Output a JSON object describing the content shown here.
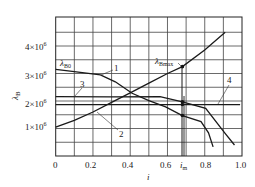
{
  "chart_data": {
    "type": "line",
    "title": "",
    "xlabel": "i",
    "ylabel": "λB",
    "xlim": [
      0,
      1.0
    ],
    "ylim": [
      0,
      5000000
    ],
    "grid": true,
    "x_ticks": [
      "0",
      "0.2",
      "0.4",
      "0.6",
      "0.8",
      "1.0"
    ],
    "x_tick_values": [
      0,
      0.2,
      0.4,
      0.6,
      0.8,
      1.0
    ],
    "y_ticks": [
      "1×10⁶",
      "2×10⁶",
      "3×10⁶",
      "4×10⁶"
    ],
    "y_tick_values": [
      1000000,
      2000000,
      3000000,
      4000000
    ],
    "special_x_tick": {
      "label": "i_m",
      "value": 0.68
    },
    "series": [
      {
        "name": "1",
        "x": [
          0,
          0.1,
          0.24,
          0.32,
          0.41,
          0.5,
          0.59,
          0.68,
          0.78,
          0.82,
          0.845
        ],
        "y": [
          3150000,
          3070000,
          2950000,
          2700000,
          2280000,
          2010000,
          1790000,
          1470000,
          1250000,
          840000,
          330000
        ]
      },
      {
        "name": "2",
        "x": [
          0,
          0.1,
          0.2,
          0.3,
          0.4,
          0.5,
          0.6,
          0.68,
          0.8,
          0.91
        ],
        "y": [
          1050000,
          1300000,
          1600000,
          1950000,
          2300000,
          2650000,
          3000000,
          3250000,
          3850000,
          4500000
        ]
      },
      {
        "name": "3",
        "x": [
          0,
          0.3,
          0.56,
          0.68,
          0.805,
          0.907,
          0.96
        ],
        "y": [
          2160000,
          2150000,
          2160000,
          1970000,
          1730000,
          840000,
          400000
        ]
      },
      {
        "name": "4",
        "x": [
          0,
          0.99
        ],
        "y": [
          1870000,
          1870000
        ]
      }
    ],
    "annotations": [
      {
        "text": "λB0",
        "x": 0,
        "y": 3150000,
        "note": "starting value of curve 1"
      },
      {
        "text": "λBmax",
        "x": 0.68,
        "y": 3250000,
        "note": "maximum point on curve 2 at i_m"
      }
    ],
    "marker_points": [
      {
        "x": 0.68,
        "y": 3250000
      },
      {
        "x": 0.68,
        "y": 1970000
      },
      {
        "x": 0.68,
        "y": 1870000
      },
      {
        "x": 0.68,
        "y": 1470000
      }
    ]
  },
  "labels": {
    "y_axis": "λ",
    "y_axis_sub": "B",
    "x_axis": "i",
    "lambda_b0": "λ",
    "lambda_b0_sub": "B0",
    "lambda_bmax": "λ",
    "lambda_bmax_sub": "Bmax",
    "im": "i",
    "im_sub": "m",
    "curve_1": "1",
    "curve_2": "2",
    "curve_3": "3",
    "curve_4": "4",
    "x_tick_0": "0",
    "x_tick_02": "0.2",
    "x_tick_04": "0.4",
    "x_tick_06": "0.6",
    "x_tick_08": "0.8",
    "x_tick_10": "1.0",
    "y_tick_1": "1×10",
    "y_tick_2": "2×10",
    "y_tick_3": "3×10",
    "y_tick_4": "4×10",
    "exp": "6"
  }
}
